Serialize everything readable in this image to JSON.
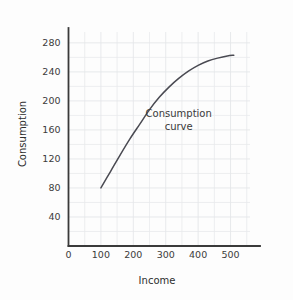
{
  "chart_data": {
    "type": "line",
    "title": "",
    "xlabel": "Income",
    "ylabel": "Consumption",
    "xlim": [
      0,
      560
    ],
    "ylim": [
      0,
      295
    ],
    "grid": true,
    "legend": "none",
    "annotations": [
      {
        "text_line1": "Consumption",
        "text_line2": "curve",
        "x": 340,
        "y": 178
      }
    ],
    "xticks": [
      0,
      100,
      200,
      300,
      400,
      500
    ],
    "xtick_labels": [
      "0",
      "100",
      "200",
      "300",
      "400",
      "500"
    ],
    "yticks": [
      40,
      80,
      120,
      160,
      200,
      240,
      280
    ],
    "ytick_labels": [
      "40",
      "80",
      "120",
      "160",
      "200",
      "240",
      "280"
    ],
    "x_minor_step": 50,
    "y_minor_step": 20,
    "series": [
      {
        "name": "Consumption curve",
        "color": "#4a4a52",
        "x": [
          100,
          130,
          160,
          190,
          220,
          250,
          280,
          310,
          340,
          370,
          400,
          430,
          460,
          490,
          510
        ],
        "y": [
          80,
          103,
          126,
          148,
          168,
          188,
          205,
          219,
          231,
          241,
          249,
          255,
          259,
          262,
          263
        ]
      }
    ]
  },
  "axes": {
    "x_title": "Income",
    "y_title": "Consumption"
  },
  "colors": {
    "curve": "#4a4a52",
    "axis": "#3a3a3a",
    "grid": "#e9eaec",
    "text": "#3b3b3b",
    "background": "#fdfdfd"
  }
}
